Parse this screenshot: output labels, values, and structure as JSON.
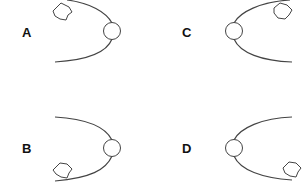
{
  "panels": [
    {
      "id": "A",
      "label": "A",
      "central_body": "left-of-circle-open",
      "orbit_direction": "opens-left",
      "object_position": "top-left"
    },
    {
      "id": "B",
      "label": "B",
      "orbit_direction": "opens-left",
      "object_position": "bottom-left"
    },
    {
      "id": "C",
      "label": "C",
      "orbit_direction": "opens-right",
      "object_position": "top-right"
    },
    {
      "id": "D",
      "label": "D",
      "orbit_direction": "opens-right",
      "object_position": "bottom-right"
    }
  ],
  "colors": {
    "stroke": "#444444",
    "label": "#111111",
    "background": "#ffffff"
  }
}
